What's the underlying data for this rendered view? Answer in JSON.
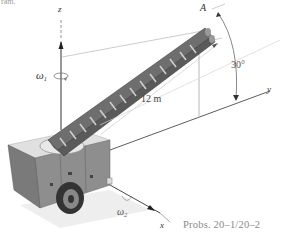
{
  "header": {
    "cut_text": "ram."
  },
  "diagram": {
    "axes": {
      "z_label": "z",
      "y_label": "y",
      "x_label": "x"
    },
    "angular_velocities": {
      "omega1_symbol": "ω",
      "omega1_sub": "1",
      "omega2_symbol": "ω",
      "omega2_sub": "2"
    },
    "point_label": "A",
    "ladder_length": "12 m",
    "angle": "30°",
    "colors": {
      "ladder": "#7d7d7d",
      "ladder_dark": "#5a5a5a",
      "truck_body": "#8c8c8c",
      "truck_top": "#d9d9d9",
      "axis_line": "#333333",
      "dim_line": "#bdbdbd"
    }
  },
  "caption": "Probs. 20–1/20–2"
}
